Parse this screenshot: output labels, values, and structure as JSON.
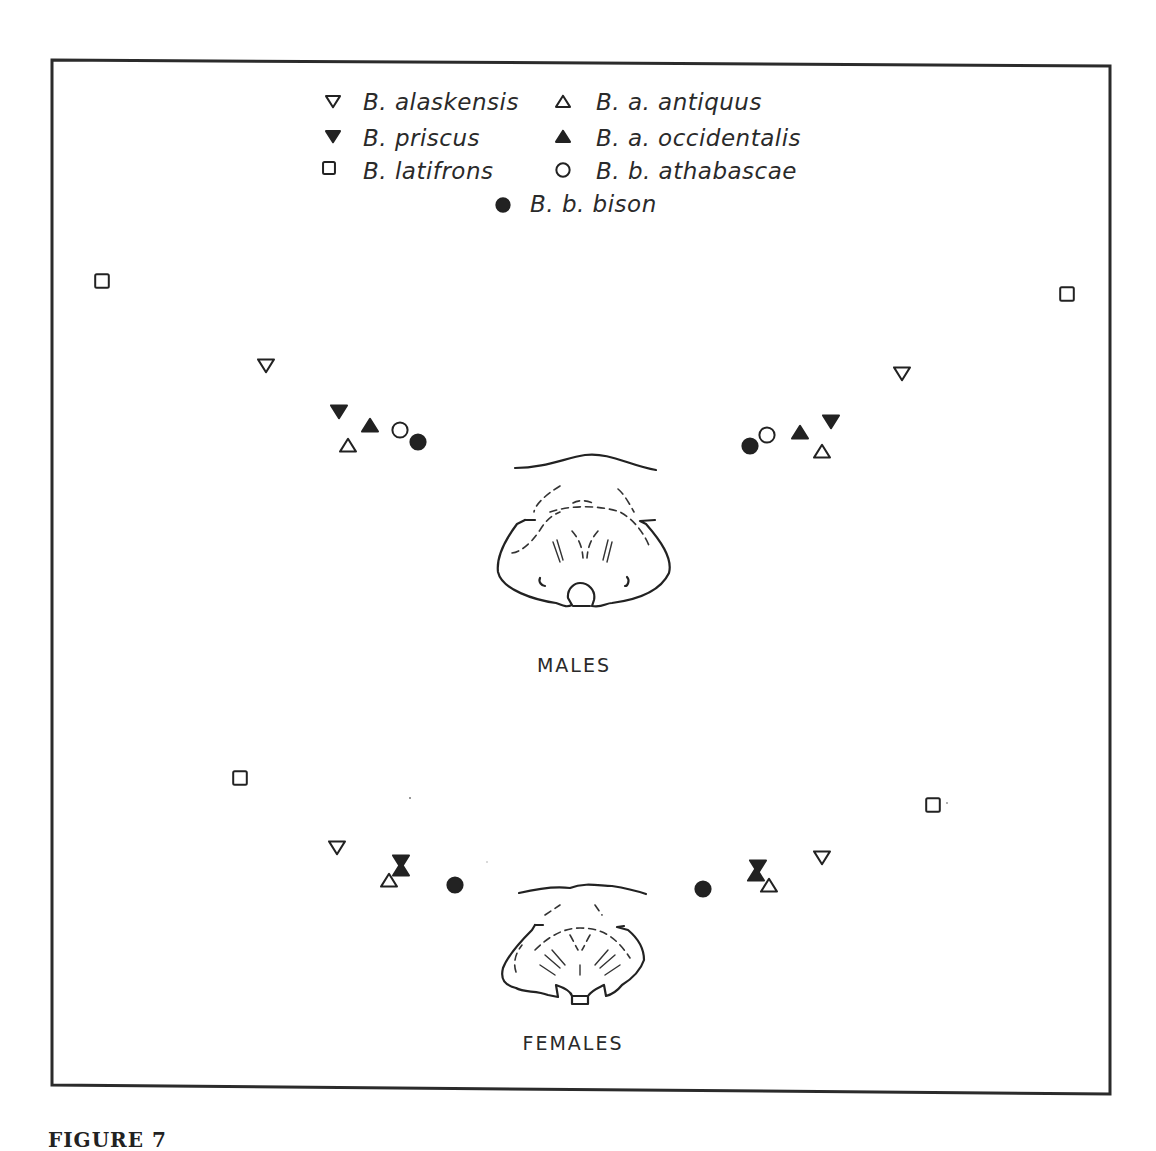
{
  "figure": {
    "caption_fragment": "FIGURE 7",
    "frame": {
      "left": 52,
      "top": 60,
      "right": 1110,
      "bottom": 1090
    },
    "colors": {
      "ink": "#222222",
      "paper": "#ffffff"
    }
  },
  "legend": {
    "items": [
      {
        "species": "B. alaskensis",
        "symbol": "triangle-down-open",
        "x": 333,
        "y": 101,
        "tx": 363,
        "ty": 110
      },
      {
        "species": "B. a. antiquus",
        "symbol": "triangle-up-open",
        "x": 563,
        "y": 102,
        "tx": 596,
        "ty": 110
      },
      {
        "species": "B. priscus",
        "symbol": "triangle-down-filled",
        "x": 333,
        "y": 136,
        "tx": 363,
        "ty": 146
      },
      {
        "species": "B. a. occidentalis",
        "symbol": "triangle-up-filled",
        "x": 563,
        "y": 137,
        "tx": 596,
        "ty": 146
      },
      {
        "species": "B. latifrons",
        "symbol": "square-open",
        "x": 329,
        "y": 168,
        "tx": 363,
        "ty": 179
      },
      {
        "species": "B. b. athabascae",
        "symbol": "circle-open",
        "x": 563,
        "y": 170,
        "tx": 596,
        "ty": 179
      },
      {
        "species": "B. b. bison",
        "symbol": "circle-filled",
        "x": 503,
        "y": 205,
        "tx": 530,
        "ty": 212
      }
    ]
  },
  "groups": {
    "males": {
      "label": "MALES",
      "label_x": 574,
      "label_y": 672
    },
    "females": {
      "label": "FEMALES",
      "label_x": 573,
      "label_y": 1050
    }
  },
  "chart_data": {
    "type": "scatter",
    "title": "",
    "legend": [
      "B. alaskensis",
      "B. a. antiquus",
      "B. priscus",
      "B. a. occidentalis",
      "B. latifrons",
      "B. b. athabascae",
      "B. b. bison"
    ],
    "axes": "none",
    "grid": false,
    "legend_position": "top-center",
    "series": [
      {
        "group": "males",
        "side": "left",
        "points": [
          {
            "species": "B. latifrons",
            "symbol": "square-open",
            "x": 102,
            "y": 281
          },
          {
            "species": "B. alaskensis",
            "symbol": "triangle-down-open",
            "x": 266,
            "y": 365
          },
          {
            "species": "B. priscus",
            "symbol": "triangle-down-filled",
            "x": 339,
            "y": 411
          },
          {
            "species": "B. a. occidentalis",
            "symbol": "triangle-up-filled",
            "x": 370,
            "y": 426
          },
          {
            "species": "B. a. antiquus",
            "symbol": "triangle-up-open",
            "x": 348,
            "y": 446
          },
          {
            "species": "B. b. athabascae",
            "symbol": "circle-open",
            "x": 400,
            "y": 430
          },
          {
            "species": "B. b. bison",
            "symbol": "circle-filled",
            "x": 418,
            "y": 442
          }
        ]
      },
      {
        "group": "males",
        "side": "right",
        "points": [
          {
            "species": "B. latifrons",
            "symbol": "square-open",
            "x": 1067,
            "y": 294
          },
          {
            "species": "B. alaskensis",
            "symbol": "triangle-down-open",
            "x": 902,
            "y": 373
          },
          {
            "species": "B. priscus",
            "symbol": "triangle-down-filled",
            "x": 831,
            "y": 421
          },
          {
            "species": "B. a. occidentalis",
            "symbol": "triangle-up-filled",
            "x": 800,
            "y": 433
          },
          {
            "species": "B. a. antiquus",
            "symbol": "triangle-up-open",
            "x": 822,
            "y": 452
          },
          {
            "species": "B. b. athabascae",
            "symbol": "circle-open",
            "x": 767,
            "y": 435
          },
          {
            "species": "B. b. bison",
            "symbol": "circle-filled",
            "x": 750,
            "y": 446
          }
        ]
      },
      {
        "group": "females",
        "side": "left",
        "points": [
          {
            "species": "B. latifrons",
            "symbol": "square-open",
            "x": 240,
            "y": 778
          },
          {
            "species": "B. alaskensis",
            "symbol": "triangle-down-open",
            "x": 337,
            "y": 847
          },
          {
            "species": "B. priscus",
            "symbol": "triangle-down-filled",
            "x": 401,
            "y": 861
          },
          {
            "species": "B. a. occidentalis",
            "symbol": "triangle-up-filled",
            "x": 401,
            "y": 870
          },
          {
            "species": "B. a. antiquus",
            "symbol": "triangle-up-open",
            "x": 389,
            "y": 881
          },
          {
            "species": "B. b. bison",
            "symbol": "circle-filled",
            "x": 455,
            "y": 885
          }
        ]
      },
      {
        "group": "females",
        "side": "right",
        "points": [
          {
            "species": "B. latifrons",
            "symbol": "square-open",
            "x": 933,
            "y": 805
          },
          {
            "species": "B. alaskensis",
            "symbol": "triangle-down-open",
            "x": 822,
            "y": 857
          },
          {
            "species": "B. priscus",
            "symbol": "triangle-down-filled",
            "x": 758,
            "y": 866
          },
          {
            "species": "B. a. occidentalis",
            "symbol": "triangle-up-filled",
            "x": 756,
            "y": 875
          },
          {
            "species": "B. a. antiquus",
            "symbol": "triangle-up-open",
            "x": 769,
            "y": 886
          },
          {
            "species": "B. b. bison",
            "symbol": "circle-filled",
            "x": 703,
            "y": 889
          }
        ]
      }
    ]
  }
}
